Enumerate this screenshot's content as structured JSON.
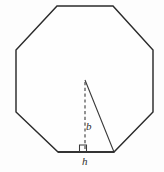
{
  "figure": {
    "background_color": "#fdfdfd",
    "stroke_color": "#2b2b2b",
    "labels": {
      "altitude": "b",
      "base": "h"
    },
    "shapes": {
      "octagon": {
        "name": "octagon",
        "sides": 8,
        "points": "57,6 113,6 153,50 153,112 114,152 58,152 16,112 16,50"
      },
      "triangle": {
        "name": "isosceles-triangle",
        "apex": "85,80",
        "base_left": "58,152",
        "base_right": "114,152",
        "points": "85,80 114,152 58,152"
      },
      "altitude": {
        "name": "altitude-dashed-line",
        "x1": 85,
        "y1": 82,
        "x2": 85,
        "y2": 151,
        "style": "dashed"
      },
      "right_angle_marker": {
        "name": "right-angle-marker",
        "points": "79.5,152 79.5,145 86.5,145 86.5,152"
      }
    }
  }
}
